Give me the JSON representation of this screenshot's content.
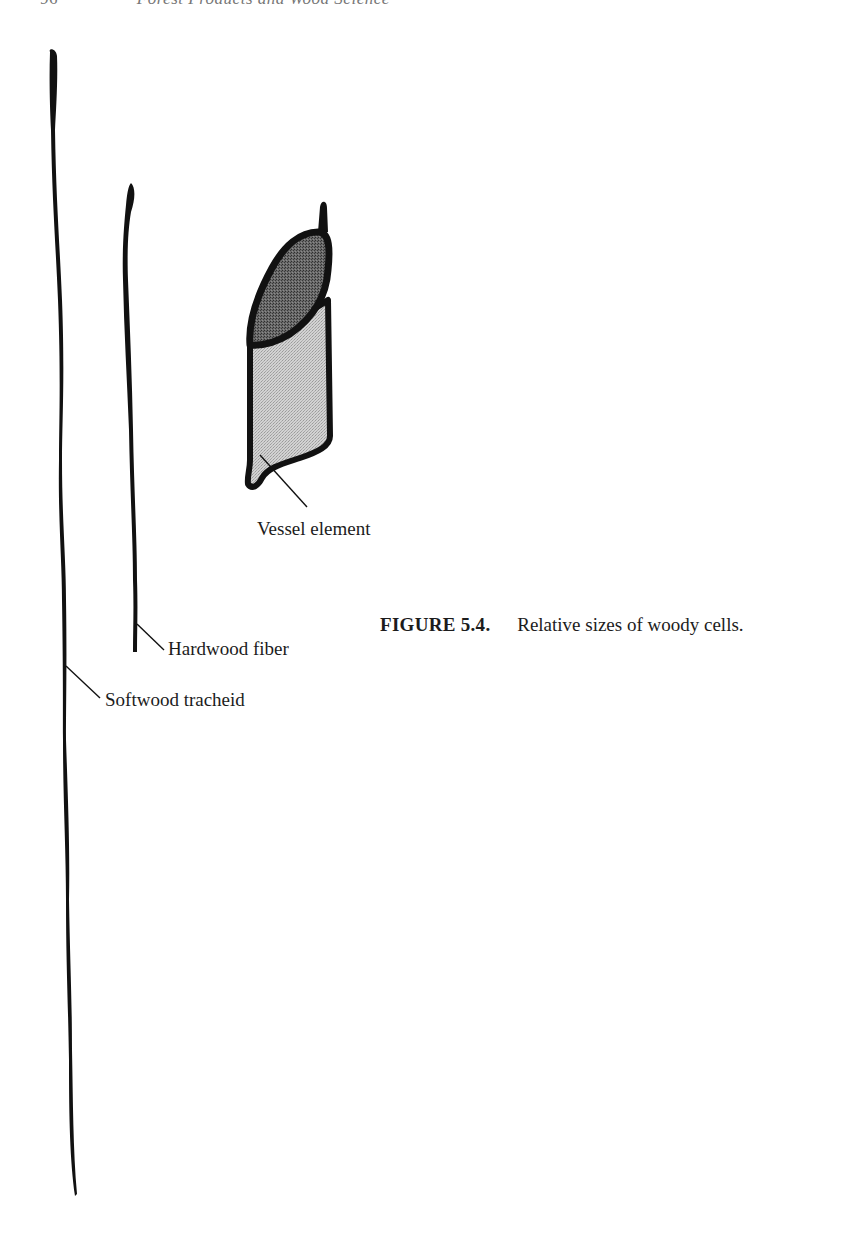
{
  "running_header": {
    "page_number": "96",
    "book_title": "Forest Products and Wood Science"
  },
  "figure": {
    "number": "FIGURE 5.4.",
    "caption": "Relative sizes of woody cells.",
    "labels": {
      "vessel": "Vessel element",
      "fiber": "Hardwood fiber",
      "tracheid": "Softwood tracheid"
    },
    "colors": {
      "outline": "#111111",
      "vessel_body_fill": "#c9c9c9",
      "vessel_opening_fill": "#5a5a5a",
      "background": "#ffffff"
    }
  }
}
